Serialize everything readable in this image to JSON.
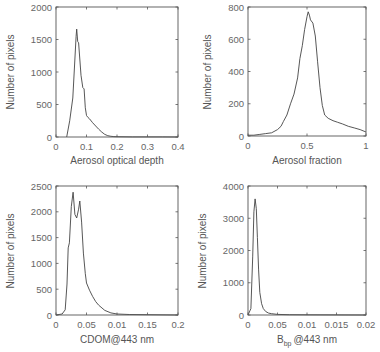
{
  "chart_data": [
    {
      "type": "line",
      "panel": "top-left",
      "title": "",
      "xlabel": "Aerosol optical depth",
      "ylabel": "Number of pixels",
      "xlim": [
        0,
        0.4
      ],
      "ylim": [
        0,
        2000
      ],
      "xticks": [
        0,
        0.1,
        0.2,
        0.3,
        0.4
      ],
      "xtick_labels": [
        "0",
        "0.1",
        "0.2",
        "0.3",
        "0.4"
      ],
      "yticks": [
        0,
        500,
        1000,
        1500,
        2000
      ],
      "ytick_labels": [
        "0",
        "500",
        "1000",
        "1500",
        "2000"
      ],
      "grid": false,
      "x": [
        0.035,
        0.045,
        0.055,
        0.062,
        0.066,
        0.068,
        0.071,
        0.074,
        0.078,
        0.082,
        0.088,
        0.092,
        0.096,
        0.1,
        0.105,
        0.11,
        0.12,
        0.13,
        0.14,
        0.15,
        0.16,
        0.17,
        0.18,
        0.19,
        0.2,
        0.25,
        0.3,
        0.35,
        0.4
      ],
      "y": [
        0,
        250,
        600,
        1200,
        1550,
        1660,
        1470,
        1450,
        1200,
        950,
        760,
        740,
        450,
        330,
        300,
        280,
        220,
        170,
        120,
        75,
        40,
        20,
        10,
        6,
        4,
        2,
        1,
        1,
        0
      ]
    },
    {
      "type": "line",
      "panel": "top-right",
      "title": "",
      "xlabel": "Aerosol fraction",
      "ylabel": "Number of pixels",
      "xlim": [
        0,
        1
      ],
      "ylim": [
        0,
        800
      ],
      "xticks": [
        0,
        0.5,
        1
      ],
      "xtick_labels": [
        "0",
        "0.5",
        "1"
      ],
      "yticks": [
        0,
        200,
        400,
        600,
        800
      ],
      "ytick_labels": [
        "0",
        "200",
        "400",
        "600",
        "800"
      ],
      "grid": false,
      "x": [
        0,
        0.05,
        0.1,
        0.15,
        0.2,
        0.25,
        0.28,
        0.3,
        0.33,
        0.36,
        0.39,
        0.42,
        0.44,
        0.46,
        0.48,
        0.5,
        0.51,
        0.52,
        0.53,
        0.55,
        0.57,
        0.59,
        0.61,
        0.63,
        0.65,
        0.68,
        0.72,
        0.76,
        0.8,
        0.85,
        0.9,
        0.95,
        1.0
      ],
      "y": [
        5,
        5,
        10,
        15,
        20,
        40,
        60,
        90,
        130,
        200,
        260,
        360,
        480,
        560,
        660,
        740,
        770,
        750,
        720,
        700,
        620,
        460,
        300,
        190,
        130,
        110,
        95,
        85,
        75,
        60,
        50,
        40,
        25
      ]
    },
    {
      "type": "line",
      "panel": "bottom-left",
      "title": "",
      "xlabel": "CDOM@443 nm",
      "ylabel": "Number of pixels",
      "xlim": [
        0,
        0.2
      ],
      "ylim": [
        0,
        2500
      ],
      "xticks": [
        0,
        0.05,
        0.1,
        0.15,
        0.2
      ],
      "xtick_labels": [
        "0",
        "0.05",
        "0.01",
        "0.15",
        "0.2"
      ],
      "yticks": [
        0,
        500,
        1000,
        1500,
        2000,
        2500
      ],
      "ytick_labels": [
        "0",
        "500",
        "1000",
        "1500",
        "2000",
        "2500"
      ],
      "grid": false,
      "x": [
        0,
        0.01,
        0.015,
        0.018,
        0.02,
        0.022,
        0.025,
        0.028,
        0.031,
        0.034,
        0.037,
        0.039,
        0.042,
        0.045,
        0.048,
        0.05,
        0.055,
        0.06,
        0.065,
        0.07,
        0.08,
        0.09,
        0.1,
        0.12,
        0.15,
        0.2
      ],
      "y": [
        0,
        20,
        100,
        600,
        1300,
        1400,
        2100,
        2380,
        1950,
        1880,
        2050,
        2210,
        1800,
        1200,
        800,
        620,
        480,
        360,
        260,
        190,
        90,
        40,
        20,
        10,
        5,
        0
      ]
    },
    {
      "type": "line",
      "panel": "bottom-right",
      "title": "",
      "xlabel": "B_bp @443 nm",
      "xlabel_main": "B",
      "xlabel_sub": "bp",
      "xlabel_rest": "@443 nm",
      "ylabel": "Number of pixels",
      "xlim": [
        0,
        0.02
      ],
      "ylim": [
        0,
        4000
      ],
      "xticks": [
        0,
        0.005,
        0.01,
        0.015,
        0.02
      ],
      "xtick_labels": [
        "0",
        "0.05",
        "0.01",
        "0.015",
        "0.02"
      ],
      "yticks": [
        0,
        1000,
        2000,
        3000,
        4000
      ],
      "ytick_labels": [
        "0",
        "1000",
        "2000",
        "3000",
        "4000"
      ],
      "grid": false,
      "x": [
        0,
        0.0005,
        0.0008,
        0.001,
        0.0012,
        0.0014,
        0.0016,
        0.0018,
        0.002,
        0.0023,
        0.0026,
        0.003,
        0.0035,
        0.004,
        0.005,
        0.007,
        0.01,
        0.015,
        0.02
      ],
      "y": [
        0,
        200,
        1800,
        3200,
        3600,
        3300,
        2400,
        1400,
        700,
        350,
        200,
        110,
        60,
        40,
        20,
        10,
        5,
        2,
        0
      ]
    }
  ],
  "layout": {
    "panels": [
      {
        "left": 56,
        "top": 7,
        "right": 178,
        "bottom": 137
      },
      {
        "left": 248,
        "top": 7,
        "right": 366,
        "bottom": 136
      },
      {
        "left": 56,
        "top": 186,
        "right": 178,
        "bottom": 315
      },
      {
        "left": 248,
        "top": 186,
        "right": 366,
        "bottom": 315
      }
    ]
  }
}
